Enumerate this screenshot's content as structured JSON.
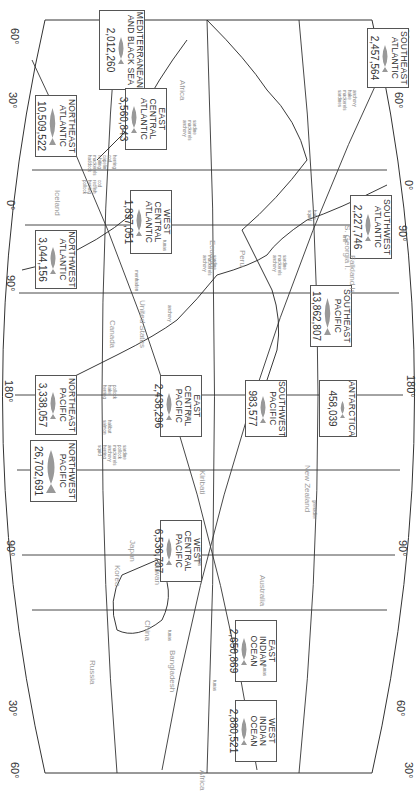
{
  "map": {
    "title": "World fishing regions and catches",
    "orientation": "rotated 90 degrees clockwise",
    "longitude_ticks_top": [
      "60°",
      "90°",
      "180°",
      "90°",
      "0°",
      "30°",
      "60°"
    ],
    "longitude_ticks_bottom": [
      "0°",
      "90°",
      "180°",
      "90°",
      "0°"
    ],
    "latitude_ticks": [
      "30°",
      "60°",
      "60°",
      "30°",
      "30°",
      "60°",
      "60°",
      "30°"
    ],
    "regions": [
      {
        "name_line1": "NORTHWEST",
        "name_line2": "PACIFIC",
        "value": "26,702,691"
      },
      {
        "name_line1": "NORTHEAST",
        "name_line2": "PACIFIC",
        "value": "3,338,057"
      },
      {
        "name_line1": "NORTHWEST",
        "name_line2": "ATLANTIC",
        "value": "3,044,156"
      },
      {
        "name_line1": "NORTHEAST",
        "name_line2": "ATLANTIC",
        "value": "10,509,522"
      },
      {
        "name_line1": "MEDITERRANEAN",
        "name_line2": "AND BLACK SEA",
        "value": "2,012,260"
      },
      {
        "name_line1": "WEST CENTRAL",
        "name_line2": "PACIFIC",
        "value": "6,536,707"
      },
      {
        "name_line1": "EAST CENTRAL",
        "name_line2": "PACIFIC",
        "value": "2,438,296"
      },
      {
        "name_line1": "WEST CENTRAL",
        "name_line2": "ATLANTIC",
        "value": "1,897,051"
      },
      {
        "name_line1": "EAST CENTRAL",
        "name_line2": "ATLANTIC",
        "value": "3,560,843"
      },
      {
        "name_line1": "EAST",
        "name_line2": "INDIAN OCEAN",
        "value": "2,650,869"
      },
      {
        "name_line1": "WEST",
        "name_line2": "INDIAN OCEAN",
        "value": "2,880,521"
      },
      {
        "name_line1": "SOUTHWEST",
        "name_line2": "PACIFIC",
        "value": "983,577"
      },
      {
        "name_line1": "SOUTHEAST",
        "name_line2": "PACIFIC",
        "value": "13,862,807"
      },
      {
        "name_line1": "SOUTHWEST",
        "name_line2": "ATLANTIC",
        "value": "2,227,746"
      },
      {
        "name_line1": "SOUTHEAST",
        "name_line2": "ATLANTIC",
        "value": "2,457,564"
      },
      {
        "name_line1": "ANTARCTICA",
        "name_line2": "",
        "value": "458,039"
      }
    ],
    "countries": [
      "Russia",
      "China",
      "Bangladesh",
      "Korea",
      "Japan",
      "Taiwan",
      "Kiribati",
      "Australia",
      "New Zealand",
      "Canada",
      "United States",
      "Ecuador",
      "Peru",
      "Iceland",
      "Africa",
      "Africa",
      "Falkland Is.",
      "S. Georgia I."
    ],
    "species_labels": [
      "sardine\npollock\nmackerels\nanchovy\nherring\nsquid",
      "halibut\nsalmon",
      "pollock\nhake\nherring",
      "tunas",
      "herring\ncod\ncapelin\nwhiting\nmackerels\nhaddock",
      "cod\nredfish\nherring\npollock",
      "menhaden",
      "anchovy",
      "tunas",
      "sardine\nmackerels\nanchovy",
      "tunas",
      "sardine\nmackerels\nanchovy",
      "tunas",
      "sardine\nmackerels\nanchovy",
      "hake\nsquid",
      "krill",
      "anchovy\nhake\nmackerels\nsardines",
      "grenadier",
      "tunas",
      "tunas"
    ]
  }
}
